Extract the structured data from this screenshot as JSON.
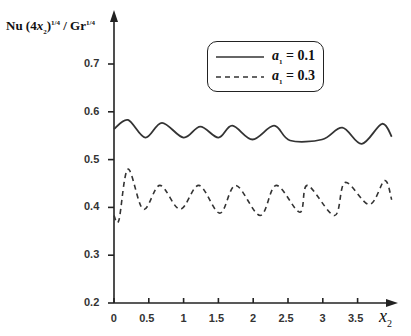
{
  "chart_data": {
    "type": "line",
    "title": "",
    "ylabel": "Nu (4x2)^1/4 / Gr^1/4",
    "xlabel": "x2",
    "xlim": [
      0,
      3.9
    ],
    "ylim": [
      0.2,
      0.78
    ],
    "x_ticks": [
      "0",
      "0.5",
      "1",
      "1.5",
      "2",
      "2.5",
      "3",
      "3.5"
    ],
    "y_ticks": [
      "0.2",
      "0.3",
      "0.4",
      "0.5",
      "0.6",
      "0.7"
    ],
    "grid": false,
    "legend_position": "upper right",
    "series": [
      {
        "name": "a1 = 0.1",
        "style": "solid",
        "x": [
          0.0,
          0.2,
          0.45,
          0.69,
          1.0,
          1.24,
          1.5,
          1.7,
          1.99,
          2.3,
          2.53,
          2.99,
          3.28,
          3.56,
          3.85,
          3.99
        ],
        "y": [
          0.564,
          0.583,
          0.546,
          0.577,
          0.546,
          0.569,
          0.546,
          0.571,
          0.542,
          0.571,
          0.54,
          0.542,
          0.567,
          0.533,
          0.575,
          0.548
        ]
      },
      {
        "name": "a1 = 0.3",
        "style": "dashed",
        "x": [
          0.0,
          0.07,
          0.2,
          0.42,
          0.66,
          0.95,
          1.22,
          1.52,
          1.75,
          2.1,
          2.33,
          2.67,
          2.78,
          3.17,
          3.32,
          3.67,
          3.89,
          3.99
        ],
        "y": [
          0.383,
          0.373,
          0.48,
          0.396,
          0.446,
          0.396,
          0.446,
          0.388,
          0.446,
          0.383,
          0.446,
          0.39,
          0.446,
          0.383,
          0.452,
          0.406,
          0.456,
          0.416
        ]
      }
    ]
  },
  "labels": {
    "y_axis": {
      "base": "Nu (4",
      "var": "x",
      "var_sub": "2",
      "close": ")",
      "exp": "1/4",
      "mid": " / Gr",
      "exp2": "1/4"
    },
    "x_axis": {
      "var": "x",
      "sub": "2"
    },
    "legend": [
      {
        "var": "a",
        "sub": "1",
        "eq": " = 0.1"
      },
      {
        "var": "a",
        "sub": "1",
        "eq": " = 0.3"
      }
    ]
  },
  "colors": {
    "line": "#333333",
    "axis": "#222222"
  }
}
